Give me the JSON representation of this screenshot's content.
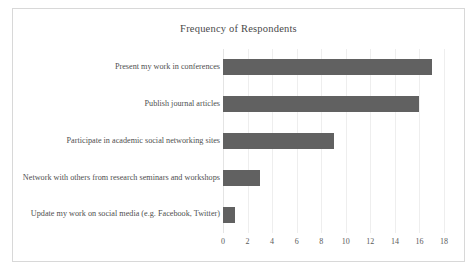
{
  "chart_data": {
    "type": "bar",
    "orientation": "horizontal",
    "title": "Frequency of Respondents",
    "xlabel": "",
    "ylabel": "",
    "xlim": [
      0,
      18
    ],
    "xticks": [
      0,
      2,
      4,
      6,
      8,
      10,
      12,
      14,
      16,
      18
    ],
    "grid": true,
    "legend": false,
    "bar_color": "#616161",
    "categories": [
      "Present my work in conferences",
      "Publish journal articles",
      "Participate in academic social networking sites",
      "Network with others from research seminars and workshops",
      "Update my work on social media (e.g. Facebook, Twitter)"
    ],
    "values": [
      17,
      16,
      9,
      3,
      1
    ]
  }
}
